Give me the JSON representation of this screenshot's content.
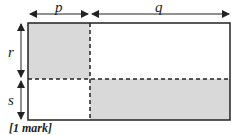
{
  "diagram": {
    "labels": {
      "top_left": "p",
      "top_right": "q",
      "left_top": "r",
      "left_bottom": "s"
    },
    "footer": "[1 mark]",
    "colors": {
      "shaded": "#d9d9d9",
      "stroke": "#222222"
    }
  }
}
